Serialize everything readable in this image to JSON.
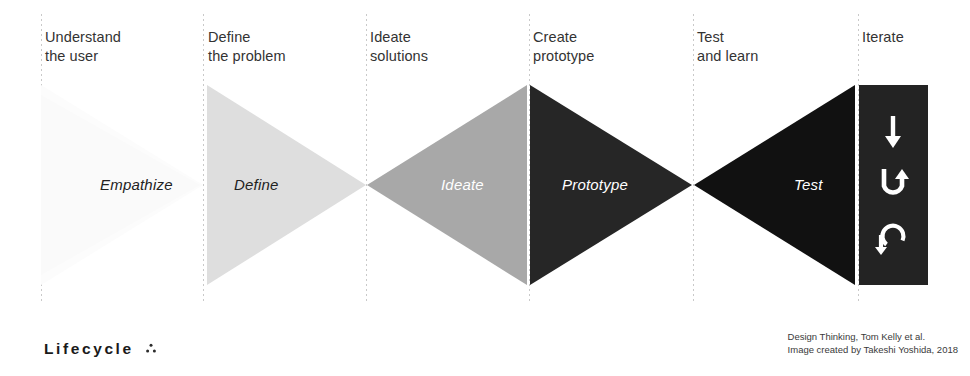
{
  "diagram": {
    "columns": [
      {
        "header": "Understand\nthe user",
        "phase": "Empathize",
        "label_color": "#222222",
        "fill": "#fbfbfb"
      },
      {
        "header": "Define\nthe problem",
        "phase": "Define",
        "label_color": "#222222",
        "fill": "#dedede"
      },
      {
        "header": "Ideate\nsolutions",
        "phase": "Ideate",
        "label_color": "#ffffff",
        "fill": "#a8a8a8"
      },
      {
        "header": "Create\nprototype",
        "phase": "Prototype",
        "label_color": "#ffffff",
        "fill": "#262626"
      },
      {
        "header": "Test\nand learn",
        "phase": "Test",
        "label_color": "#ffffff",
        "fill": "#111111"
      },
      {
        "header": "Iterate",
        "phase": "",
        "label_color": "#ffffff",
        "fill": "#232323"
      }
    ],
    "iterate_icons": [
      "arrow-right-icon",
      "u-turn-arrow-icon",
      "loop-arrow-icon"
    ],
    "guide_line_color": "#c9c9c9"
  },
  "footer": {
    "brand": "Lifecycle",
    "brand_mark": "three-dots-icon",
    "credit_line_1": "Design Thinking, Tom Kelly et al.",
    "credit_line_2": "Image created by Takeshi Yoshida, 2018",
    "credit": "Design Thinking, Tom Kelly et al.\nImage created by Takeshi Yoshida, 2018"
  }
}
